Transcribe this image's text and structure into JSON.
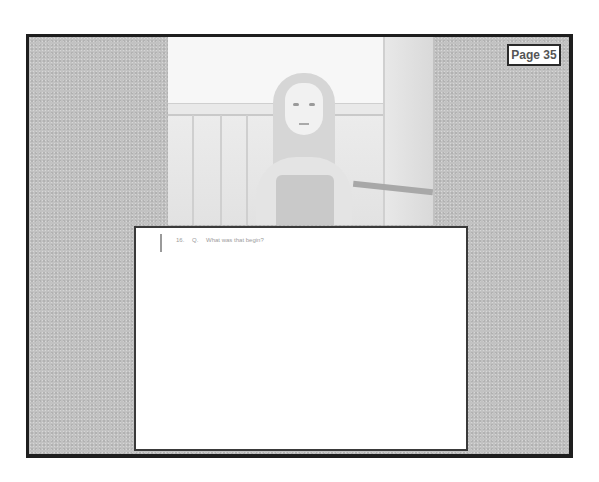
{
  "page": {
    "badge_label": "Page 35"
  },
  "video": {
    "description": "Video still of a woman with long curly blonde hair seated in front of a wooden-paneled wall"
  },
  "transcript": {
    "lines": [
      {
        "line_number": "16.",
        "speaker": "Q.",
        "text": "What was that begin?"
      }
    ]
  }
}
